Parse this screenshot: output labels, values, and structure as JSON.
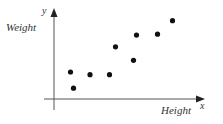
{
  "chart_data": {
    "type": "scatter",
    "title": "",
    "xlabel": "Height",
    "ylabel": "Weight",
    "x_axis_symbol": "x",
    "y_axis_symbol": "y",
    "grid": false,
    "legend": null,
    "ticks": "none",
    "xlim": [
      0,
      10
    ],
    "ylim": [
      0,
      10
    ],
    "points": [
      {
        "x": 1.1,
        "y": 3.0
      },
      {
        "x": 1.3,
        "y": 1.2
      },
      {
        "x": 2.4,
        "y": 2.7
      },
      {
        "x": 3.7,
        "y": 2.7
      },
      {
        "x": 4.1,
        "y": 5.8
      },
      {
        "x": 5.3,
        "y": 4.3
      },
      {
        "x": 5.5,
        "y": 7.1
      },
      {
        "x": 6.9,
        "y": 7.2
      },
      {
        "x": 7.9,
        "y": 8.7
      }
    ],
    "colors": {
      "points": "#111111",
      "axes": "#333333"
    }
  }
}
